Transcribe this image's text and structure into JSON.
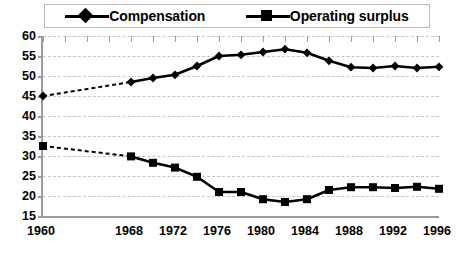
{
  "legend": {
    "position": "top",
    "entries": [
      {
        "label": "Compensation",
        "marker": "diamond",
        "color": "#000000"
      },
      {
        "label": "Operating surplus",
        "marker": "square",
        "color": "#000000"
      }
    ]
  },
  "chart_data": {
    "type": "line",
    "title": "",
    "subtitle": "",
    "xlabel": "",
    "ylabel": "",
    "grid": true,
    "legend_position": "top",
    "xlim": [
      1960,
      1996
    ],
    "ylim": [
      15,
      60
    ],
    "ytick_values": [
      15,
      20,
      25,
      30,
      35,
      40,
      45,
      50,
      55,
      60
    ],
    "ytick_labels": [
      "15",
      "20",
      "25",
      "30",
      "35",
      "40",
      "45",
      "50",
      "55",
      "60"
    ],
    "xtick_values": [
      1960,
      1962,
      1964,
      1966,
      1968,
      1970,
      1972,
      1974,
      1976,
      1978,
      1980,
      1982,
      1984,
      1986,
      1988,
      1990,
      1992,
      1994,
      1996
    ],
    "xtick_labels_shown": [
      "1960",
      "1968",
      "1972",
      "1976",
      "1980",
      "1984",
      "1988",
      "1992",
      "1996"
    ],
    "xtick_labels_values": [
      1960,
      1968,
      1972,
      1976,
      1980,
      1984,
      1988,
      1992,
      1996
    ],
    "x": [
      1960,
      1968,
      1970,
      1972,
      1974,
      1976,
      1978,
      1980,
      1982,
      1984,
      1986,
      1988,
      1990,
      1992,
      1994,
      1996
    ],
    "series": [
      {
        "name": "Compensation",
        "marker": "diamond",
        "color": "#000000",
        "gap_after_first_point": true,
        "values": [
          45.0,
          48.5,
          49.5,
          50.3,
          52.5,
          55.0,
          55.3,
          56.0,
          56.7,
          55.8,
          53.8,
          52.2,
          52.0,
          52.5,
          52.0,
          52.3
        ]
      },
      {
        "name": "Operating surplus",
        "marker": "square",
        "color": "#000000",
        "gap_after_first_point": true,
        "values": [
          32.5,
          29.9,
          28.3,
          27.1,
          24.8,
          21.0,
          21.0,
          19.2,
          18.5,
          19.2,
          21.5,
          22.2,
          22.2,
          22.0,
          22.3,
          21.8
        ]
      }
    ]
  },
  "colors": {
    "series": "#000000",
    "grid": "#c4c4c4",
    "axis": "#9b9b9b",
    "background": "#ffffff",
    "legend_border": "#b9b9b9"
  }
}
